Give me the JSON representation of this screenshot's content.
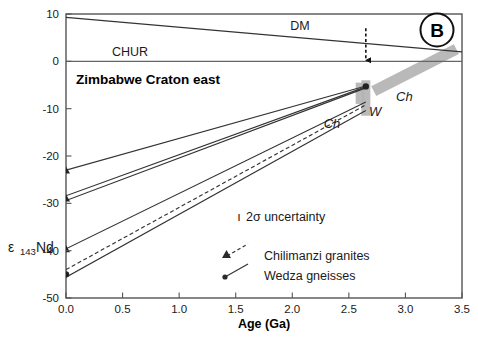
{
  "panel": {
    "label": "B"
  },
  "axes": {
    "xlabel": "Age (Ga)",
    "ylabel_eps": "ε",
    "ylabel_sub": "143",
    "ylabel_nd": "Nd",
    "xticks": [
      "0.0",
      "0.5",
      "1.0",
      "1.5",
      "2.0",
      "2.5",
      "3.0",
      "3.5"
    ],
    "yticks": [
      "10",
      "0",
      "-10",
      "-20",
      "-30",
      "-40",
      "-50"
    ]
  },
  "annotations": {
    "dm": "DM",
    "chur": "CHUR",
    "region": "Zimbabwe Craton east",
    "ch_lower": "Ch",
    "w_bar": "W",
    "ch_band": "Ch"
  },
  "legend": {
    "uncertainty": "2σ uncertainty",
    "uncertainty_tick": "ı",
    "items": [
      {
        "label": "Chilimanzi granites",
        "marker": "triangle-marker",
        "line": "dashed"
      },
      {
        "label": "Wedza gneisses",
        "marker": "dot-marker",
        "line": "solid"
      }
    ]
  },
  "colors": {
    "axis": "#555555",
    "line": "#333333",
    "band": "#b4b4b4",
    "text": "#1a1a1a"
  },
  "chart_data": {
    "type": "line",
    "title": "Zimbabwe Craton east",
    "xlabel": "Age (Ga)",
    "ylabel": "ε143Nd",
    "xlim": [
      0.0,
      3.5
    ],
    "ylim": [
      -50,
      10
    ],
    "grid": false,
    "legend_position": "center-right-inside",
    "xticks": [
      0.0,
      0.5,
      1.0,
      1.5,
      2.0,
      2.5,
      3.0,
      3.5
    ],
    "yticks": [
      10,
      0,
      -10,
      -20,
      -30,
      -40,
      -50
    ],
    "reference_lines": [
      {
        "name": "DM",
        "style": "solid",
        "points": [
          [
            0.0,
            9.3
          ],
          [
            3.5,
            2.0
          ]
        ]
      },
      {
        "name": "CHUR",
        "style": "solid",
        "points": [
          [
            0.0,
            0.0
          ],
          [
            3.5,
            0.0
          ]
        ]
      }
    ],
    "series": [
      {
        "name": "Chilimanzi granites",
        "group": "Chilimanzi",
        "style": "solid",
        "marker": "triangle",
        "points": [
          [
            0.0,
            -23.0
          ],
          [
            2.65,
            -5.2
          ]
        ]
      },
      {
        "name": "Chilimanzi granites",
        "group": "Chilimanzi",
        "style": "solid",
        "marker": "triangle",
        "points": [
          [
            0.0,
            -28.4
          ],
          [
            2.65,
            -5.4
          ]
        ]
      },
      {
        "name": "Chilimanzi granites",
        "group": "Chilimanzi",
        "style": "solid",
        "marker": "triangle",
        "points": [
          [
            0.0,
            -29.4
          ],
          [
            2.65,
            -5.6
          ]
        ]
      },
      {
        "name": "Wedza gneisses",
        "group": "Wedza",
        "style": "solid",
        "marker": "dot",
        "points": [
          [
            0.0,
            -39.6
          ],
          [
            2.65,
            -8.6
          ]
        ]
      },
      {
        "name": "Wedza gneisses",
        "group": "Wedza",
        "style": "dashed",
        "marker": "dot",
        "points": [
          [
            0.0,
            -44.0
          ],
          [
            2.65,
            -9.2
          ]
        ]
      },
      {
        "name": "Wedza gneisses",
        "group": "Wedza",
        "style": "solid",
        "marker": "dot",
        "points": [
          [
            0.0,
            -45.6
          ],
          [
            2.65,
            -10.4
          ]
        ]
      }
    ],
    "bands": [
      {
        "name": "W",
        "orientation": "vertical",
        "x": 2.65,
        "y_range": [
          -11.5,
          -4.0
        ]
      },
      {
        "name": "Ch",
        "orientation": "vertical",
        "x": 2.6,
        "y_range": [
          -9.0,
          -4.5
        ]
      },
      {
        "name": "Ch",
        "orientation": "diagonal",
        "points": [
          [
            2.72,
            -6.3
          ],
          [
            3.45,
            2.6
          ]
        ]
      }
    ],
    "markers": [
      {
        "name": "intercept",
        "x": 0.0,
        "y": -23.0,
        "shape": "triangle"
      },
      {
        "name": "intercept",
        "x": 0.0,
        "y": -28.9,
        "shape": "triangle"
      },
      {
        "name": "intercept",
        "x": 0.0,
        "y": -39.6,
        "shape": "triangle"
      },
      {
        "name": "intercept",
        "x": 0.0,
        "y": -45.0,
        "shape": "dot"
      },
      {
        "name": "convergence",
        "x": 2.65,
        "y": -5.3,
        "shape": "dot"
      }
    ],
    "arrow": {
      "name": "age-arrow",
      "x": 2.65,
      "y_from": 7.0,
      "y_to": 0.0,
      "style": "dashed"
    }
  }
}
